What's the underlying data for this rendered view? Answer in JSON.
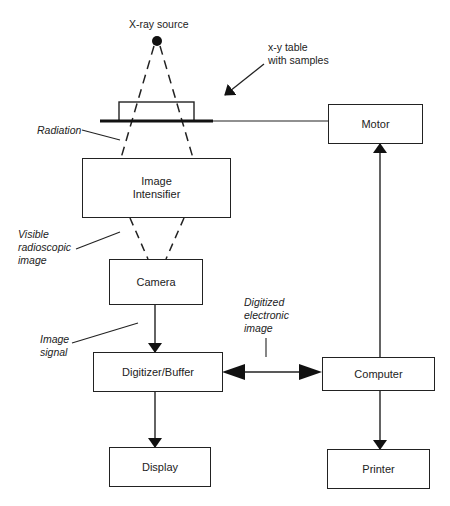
{
  "diagram": {
    "labels": {
      "xray_source": "X-ray source",
      "xy_table_line1": "x-y table",
      "xy_table_line2": "with samples",
      "radiation": "Radiation",
      "visible_line1": "Visible",
      "visible_line2": "radioscopic",
      "visible_line3": "image",
      "image_signal_line1": "Image",
      "image_signal_line2": "signal",
      "digitized_line1": "Digitized",
      "digitized_line2": "electronic",
      "digitized_line3": "image"
    },
    "boxes": {
      "motor": "Motor",
      "intensifier_line1": "Image",
      "intensifier_line2": "Intensifier",
      "camera": "Camera",
      "digitizer": "Digitizer/Buffer",
      "computer": "Computer",
      "display": "Display",
      "printer": "Printer"
    },
    "colors": {
      "stroke": "#222222",
      "background": "#ffffff"
    }
  }
}
